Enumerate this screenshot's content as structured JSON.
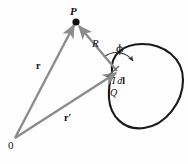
{
  "figure": {
    "background_color": "#fefefe",
    "vector_color": "#8c8c8c",
    "curve_color": "#1a1a1a",
    "text_color": "#111111",
    "width": 188,
    "height": 164
  },
  "labels": {
    "field_point": "P",
    "separation_vector": "R",
    "angle": "ϕ",
    "position_vector": "r",
    "source_position_vector": "r′",
    "current_element_I": "I",
    "current_element_d": "d",
    "current_element_l": "l",
    "source_point": "Q",
    "origin": "0"
  },
  "elements": {
    "point_P_dot": "filled-dot",
    "loop": "closed-current-loop",
    "arc": "angle-arc-phi",
    "tick": "current-element-tick"
  },
  "geometry": {
    "origin_point": [
      14,
      139
    ],
    "point_P": [
      76,
      22
    ],
    "point_Q": [
      119,
      71
    ],
    "vector_r": {
      "from": [
        14,
        139
      ],
      "to": [
        76,
        22
      ],
      "label": "r"
    },
    "vector_r_prime": {
      "from": [
        14,
        139
      ],
      "to": [
        119,
        71
      ],
      "label": "r′"
    },
    "vector_R": {
      "from": [
        119,
        71
      ],
      "to": [
        76,
        22
      ],
      "label": "R"
    },
    "angle_phi_degrees": 62
  }
}
